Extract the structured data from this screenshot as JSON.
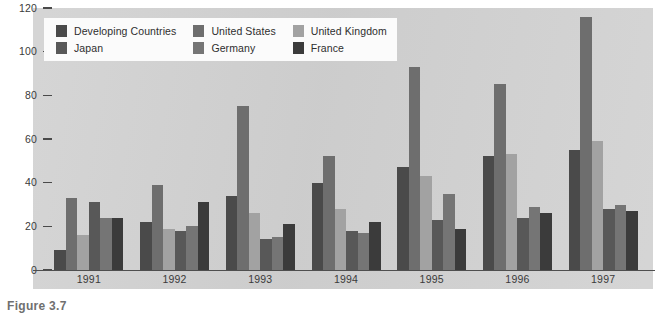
{
  "chart_data": {
    "type": "bar",
    "title": "",
    "subtitle": "",
    "xlabel": "",
    "ylabel": "",
    "ylim": [
      0,
      120
    ],
    "yticks": [
      0,
      20,
      40,
      60,
      80,
      100,
      120
    ],
    "grid": false,
    "legend_position": "top-left-inside",
    "categories": [
      "1991",
      "1992",
      "1993",
      "1994",
      "1995",
      "1996",
      "1997"
    ],
    "series": [
      {
        "name": "Developing Countries",
        "color": "#4a4a4a",
        "values": [
          9,
          22,
          34,
          40,
          47,
          52,
          55
        ]
      },
      {
        "name": "United States",
        "color": "#6e6e6e",
        "values": [
          33,
          39,
          75,
          52,
          93,
          85,
          116
        ]
      },
      {
        "name": "United Kingdom",
        "color": "#a2a2a2",
        "values": [
          16,
          19,
          26,
          28,
          43,
          53,
          59
        ]
      },
      {
        "name": "Japan",
        "color": "#585858",
        "values": [
          31,
          18,
          14,
          18,
          23,
          24,
          28
        ]
      },
      {
        "name": "Germany",
        "color": "#757575",
        "values": [
          24,
          20,
          15,
          17,
          35,
          29,
          30
        ]
      },
      {
        "name": "France",
        "color": "#3b3b3b",
        "values": [
          24,
          31,
          21,
          22,
          19,
          26,
          27
        ]
      }
    ]
  },
  "legend": {
    "entries": [
      {
        "label": "Developing Countries",
        "color": "#4a4a4a"
      },
      {
        "label": "United States",
        "color": "#6e6e6e"
      },
      {
        "label": "United Kingdom",
        "color": "#a2a2a2"
      },
      {
        "label": "Japan",
        "color": "#585858"
      },
      {
        "label": "Germany",
        "color": "#757575"
      },
      {
        "label": "France",
        "color": "#3b3b3b"
      }
    ]
  },
  "caption": {
    "text": "Figure 3.7"
  },
  "colors": {
    "panel_background": "#d3d3d3",
    "page_background": "#ffffff",
    "axis": "#4f4f4f",
    "tick_label": "#3a3a3a",
    "legend_background": "#fbfbfb"
  }
}
